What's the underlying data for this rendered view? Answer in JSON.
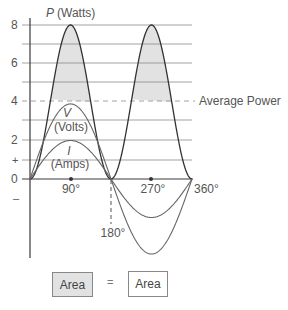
{
  "diagram": {
    "y_axis": {
      "title": "P (Watts)",
      "title_italic": "P",
      "title_unit": "(Watts)",
      "ticks": [
        "8",
        "6",
        "4",
        "2",
        "+",
        "0",
        "–"
      ]
    },
    "x_axis": {
      "ticks": [
        "90°",
        "180°",
        "270°",
        "360°"
      ]
    },
    "curves": {
      "power": {
        "label": "P",
        "unit": "(Watts)",
        "peak": 8
      },
      "voltage": {
        "label": "V",
        "unit": "(Volts)",
        "peak": 3.9
      },
      "current": {
        "label": "I",
        "unit": "(Amps)",
        "peak": 2
      }
    },
    "average_power_label": "Average Power",
    "average_power_value": 4,
    "legend": {
      "left_box": "Area",
      "equals": "=",
      "right_box": "Area"
    },
    "colors": {
      "line": "#3a3a3a",
      "grid": "#8a8a8a",
      "shade": "#e2e2e2"
    }
  },
  "chart_data": {
    "type": "line",
    "title": "",
    "xlabel": "degrees",
    "ylabel": "P (Watts)",
    "x": [
      0,
      45,
      90,
      135,
      180,
      225,
      270,
      315,
      360
    ],
    "series": [
      {
        "name": "P (Watts)",
        "values": [
          0,
          4,
          8,
          4,
          0,
          4,
          8,
          4,
          0
        ]
      },
      {
        "name": "V (Volts)",
        "values": [
          0,
          2.76,
          3.9,
          2.76,
          0,
          -2.76,
          -3.9,
          -2.76,
          0
        ]
      },
      {
        "name": "I (Amps)",
        "values": [
          0,
          1.41,
          2,
          1.41,
          0,
          -1.41,
          -2,
          -1.41,
          0
        ]
      }
    ],
    "annotations": [
      "Average Power = 4",
      "Area = Area"
    ],
    "ylim": [
      -4,
      8
    ],
    "grid": true
  }
}
